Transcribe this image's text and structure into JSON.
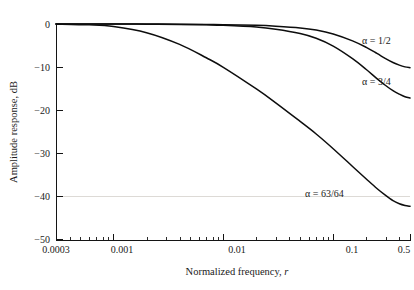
{
  "chart_data": {
    "type": "line",
    "title": "",
    "xlabel": "Normalized frequency, r",
    "ylabel": "Amplitude response, dB",
    "xscale": "log",
    "xlim": [
      0.0003,
      0.5
    ],
    "ylim": [
      -50,
      0
    ],
    "grid": false,
    "legend_position": "inline-right",
    "xticks": [
      {
        "value": 0.0003,
        "label": "0.0003"
      },
      {
        "value": 0.001,
        "label": "0.001"
      },
      {
        "value": 0.01,
        "label": "0.01"
      },
      {
        "value": 0.1,
        "label": "0.1"
      },
      {
        "value": 0.5,
        "label": "0.5"
      }
    ],
    "yticks": [
      {
        "value": 0,
        "label": "0"
      },
      {
        "value": -10,
        "label": "−10"
      },
      {
        "value": -20,
        "label": "−20"
      },
      {
        "value": -30,
        "label": "−30"
      },
      {
        "value": -40,
        "label": "−40"
      },
      {
        "value": -50,
        "label": "−50"
      }
    ],
    "series": [
      {
        "name": "alpha-one-half",
        "label": "α = 1/2",
        "x": [
          0.0003,
          0.001,
          0.002,
          0.004,
          0.007,
          0.01,
          0.02,
          0.03,
          0.05,
          0.07,
          0.1,
          0.15,
          0.2,
          0.25,
          0.3,
          0.35,
          0.4,
          0.45,
          0.5
        ],
        "values": [
          0.0,
          0.0,
          -0.02,
          -0.05,
          -0.1,
          -0.15,
          -0.3,
          -0.5,
          -0.9,
          -1.4,
          -2.3,
          -3.9,
          -5.4,
          -6.8,
          -8.0,
          -8.9,
          -9.5,
          -9.9,
          -10.1
        ]
      },
      {
        "name": "alpha-three-quarters",
        "label": "α = 3/4",
        "x": [
          0.0003,
          0.001,
          0.002,
          0.004,
          0.007,
          0.01,
          0.02,
          0.03,
          0.05,
          0.07,
          0.1,
          0.15,
          0.2,
          0.25,
          0.3,
          0.35,
          0.4,
          0.45,
          0.5
        ],
        "values": [
          0.0,
          -0.01,
          -0.04,
          -0.1,
          -0.2,
          -0.3,
          -0.7,
          -1.2,
          -2.2,
          -3.3,
          -5.1,
          -8.0,
          -10.5,
          -12.6,
          -14.2,
          -15.4,
          -16.2,
          -16.8,
          -17.1
        ]
      },
      {
        "name": "alpha-63-64",
        "label": "α = 63/64",
        "x": [
          0.0003,
          0.0006,
          0.001,
          0.002,
          0.004,
          0.007,
          0.01,
          0.02,
          0.03,
          0.05,
          0.07,
          0.1,
          0.15,
          0.2,
          0.25,
          0.3,
          0.35,
          0.4,
          0.45,
          0.5
        ],
        "values": [
          0.0,
          -0.2,
          -0.6,
          -2.0,
          -4.7,
          -7.8,
          -10.0,
          -15.0,
          -18.2,
          -22.5,
          -25.4,
          -28.8,
          -32.9,
          -35.8,
          -38.0,
          -39.6,
          -40.8,
          -41.5,
          -41.9,
          -42.1
        ]
      }
    ],
    "annotations": [
      {
        "name": "label-alpha-1-2",
        "text": "α = 1/2",
        "x_px": 362,
        "y_px": 44
      },
      {
        "name": "label-alpha-3-4",
        "text": "α = 3/4",
        "x_px": 362,
        "y_px": 85
      },
      {
        "name": "label-alpha-63-64",
        "text": "α = 63/64",
        "x_px": 305,
        "y_px": 197
      }
    ],
    "reference_line": {
      "name": "minus-40-db-guide",
      "value": -40
    }
  },
  "axis": {
    "y_title": "Amplitude response, dB",
    "x_title_main": "Normalized frequency, ",
    "x_title_var": "r"
  }
}
